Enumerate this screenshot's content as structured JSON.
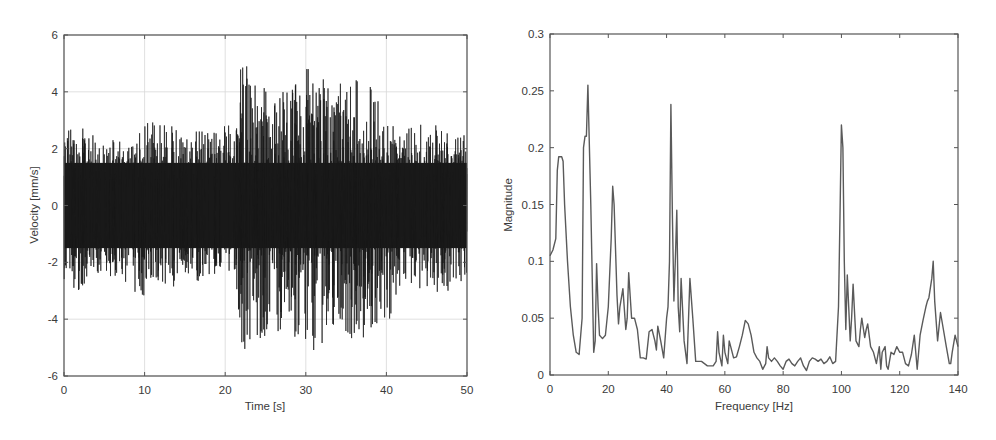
{
  "figure": {
    "background": "#ffffff",
    "axis_color": "#555555",
    "grid_color": "#d8d8d8",
    "signal_color": "#1a1a1a",
    "spectrum_color": "#5a5a5a"
  },
  "chart_data": [
    {
      "id": "time-domain",
      "type": "line",
      "title": "",
      "xlabel": "Time [s]",
      "ylabel": "Velocity [mm/s]",
      "xlim": [
        0,
        50
      ],
      "ylim": [
        -6,
        6
      ],
      "xticks": [
        0,
        10,
        20,
        30,
        40,
        50
      ],
      "xtick_labels": [
        "0",
        "10",
        "20",
        "30",
        "40",
        "50"
      ],
      "yticks": [
        -6,
        -4,
        -2,
        0,
        2,
        4,
        6
      ],
      "ytick_labels": [
        "-6",
        "-4",
        "-2",
        "0",
        "2",
        "4",
        "6"
      ],
      "grid": true,
      "frame_px": {
        "left": 64,
        "right": 467,
        "top": 35,
        "bottom": 376
      },
      "description": "Dense vibration velocity signal; approx ±2–3 mm/s envelope 0–21 s, larger bursts up to ±5–5.5 mm/s between ~21–40 s, then back to ±2–3 mm/s to 50 s",
      "envelope": {
        "t": [
          0,
          2,
          5,
          9,
          10,
          15,
          20,
          21.5,
          22,
          25,
          28,
          30,
          30.5,
          33,
          35,
          37,
          39,
          40,
          42,
          45,
          47,
          50
        ],
        "upper": [
          2.9,
          2.8,
          2.3,
          2.4,
          3.2,
          2.7,
          2.8,
          3.5,
          5.1,
          4.2,
          4.3,
          4.9,
          4.8,
          4.4,
          4.3,
          4.5,
          4.1,
          3.3,
          2.6,
          3.0,
          2.8,
          2.6
        ],
        "lower": [
          -2.6,
          -3.1,
          -2.3,
          -3.3,
          -3.3,
          -2.7,
          -2.6,
          -3.0,
          -5.3,
          -4.6,
          -4.6,
          -4.9,
          -5.6,
          -4.4,
          -4.7,
          -4.7,
          -4.5,
          -4.3,
          -2.8,
          -3.1,
          -3.2,
          -2.5
        ]
      },
      "notable_peaks": [
        {
          "t": 22.2,
          "value": 5.1
        },
        {
          "t": 30.6,
          "value": -5.6
        },
        {
          "t": 22.3,
          "value": -5.3
        }
      ]
    },
    {
      "id": "frequency-domain",
      "type": "line",
      "title": "",
      "xlabel": "Frequency [Hz]",
      "ylabel": "Magnitude",
      "xlim": [
        0,
        140
      ],
      "ylim": [
        0,
        0.3
      ],
      "xticks": [
        0,
        20,
        40,
        60,
        80,
        100,
        120,
        140
      ],
      "xtick_labels": [
        "0",
        "20",
        "40",
        "60",
        "80",
        "100",
        "120",
        "140"
      ],
      "yticks": [
        0,
        0.05,
        0.1,
        0.15,
        0.2,
        0.25,
        0.3
      ],
      "ytick_labels": [
        "0",
        "0.05",
        "0.1",
        "0.15",
        "0.2",
        "0.25",
        "0.3"
      ],
      "grid": false,
      "frame_px": {
        "left": 550,
        "right": 958,
        "top": 34,
        "bottom": 375
      },
      "x": [
        0,
        1,
        2,
        2.5,
        3,
        4,
        4.5,
        5,
        6,
        7,
        8,
        9,
        10,
        11,
        11.5,
        12,
        12.5,
        13,
        14,
        15,
        15.5,
        16,
        16.5,
        17,
        18,
        19,
        20,
        21,
        21.5,
        22,
        23,
        23.5,
        24,
        25,
        26,
        26.5,
        27,
        28,
        29,
        30,
        31,
        32,
        33,
        34,
        35,
        36,
        36.5,
        37,
        38,
        39,
        40,
        40.5,
        41,
        41.5,
        42,
        42.5,
        43,
        43.5,
        44,
        44.5,
        45,
        46,
        47,
        48,
        49,
        50,
        52,
        54,
        56,
        57,
        57.5,
        58,
        59,
        59.5,
        60,
        61,
        61.5,
        62,
        63,
        64,
        65,
        66,
        67,
        68,
        69,
        70,
        71,
        72,
        73,
        74,
        74.5,
        75,
        76,
        77,
        78,
        79,
        80,
        81,
        82,
        83,
        84,
        85,
        86,
        87,
        88,
        89,
        90,
        91,
        92,
        93,
        94,
        95,
        96,
        97,
        98,
        99,
        99.5,
        100,
        100.5,
        101,
        101.5,
        102,
        102.5,
        103,
        103.5,
        104,
        105,
        106,
        106.5,
        107,
        108,
        108.5,
        109,
        110,
        111,
        112,
        113,
        113.5,
        114,
        115,
        115.5,
        116,
        117,
        118,
        119,
        120,
        121,
        122,
        123,
        124,
        125,
        126,
        127,
        128,
        129,
        129.5,
        130,
        131,
        131.5,
        132,
        133,
        134,
        135,
        136,
        137,
        137.5,
        138,
        139,
        140
      ],
      "values": [
        0.105,
        0.11,
        0.12,
        0.18,
        0.192,
        0.192,
        0.188,
        0.15,
        0.1,
        0.06,
        0.035,
        0.02,
        0.018,
        0.05,
        0.2,
        0.21,
        0.21,
        0.255,
        0.15,
        0.02,
        0.03,
        0.098,
        0.06,
        0.035,
        0.032,
        0.035,
        0.06,
        0.12,
        0.166,
        0.15,
        0.07,
        0.045,
        0.06,
        0.076,
        0.04,
        0.05,
        0.09,
        0.05,
        0.05,
        0.04,
        0.015,
        0.015,
        0.014,
        0.038,
        0.04,
        0.03,
        0.022,
        0.043,
        0.03,
        0.015,
        0.05,
        0.06,
        0.1,
        0.238,
        0.14,
        0.065,
        0.1,
        0.145,
        0.06,
        0.038,
        0.085,
        0.03,
        0.01,
        0.085,
        0.05,
        0.012,
        0.012,
        0.008,
        0.008,
        0.012,
        0.038,
        0.02,
        0.008,
        0.035,
        0.02,
        0.01,
        0.03,
        0.025,
        0.015,
        0.016,
        0.025,
        0.035,
        0.048,
        0.045,
        0.035,
        0.02,
        0.015,
        0.012,
        0.005,
        0.01,
        0.025,
        0.015,
        0.012,
        0.015,
        0.012,
        0.008,
        0.005,
        0.012,
        0.014,
        0.01,
        0.008,
        0.012,
        0.015,
        0.008,
        0.004,
        0.012,
        0.015,
        0.014,
        0.012,
        0.014,
        0.01,
        0.012,
        0.016,
        0.01,
        0.012,
        0.06,
        0.14,
        0.22,
        0.2,
        0.1,
        0.04,
        0.088,
        0.06,
        0.03,
        0.05,
        0.08,
        0.03,
        0.025,
        0.04,
        0.05,
        0.033,
        0.04,
        0.045,
        0.025,
        0.02,
        0.01,
        0.025,
        0.005,
        0.02,
        0.025,
        0.008,
        0.005,
        0.02,
        0.018,
        0.025,
        0.02,
        0.02,
        0.01,
        0.008,
        0.018,
        0.035,
        0.005,
        0.035,
        0.048,
        0.06,
        0.065,
        0.068,
        0.085,
        0.1,
        0.065,
        0.03,
        0.055,
        0.04,
        0.025,
        0.01,
        0.01,
        0.02,
        0.035,
        0.025,
        0.01,
        0.015
      ],
      "notable_peaks": [
        {
          "freq": 3.5,
          "value": 0.192
        },
        {
          "freq": 13,
          "value": 0.255
        },
        {
          "freq": 21.5,
          "value": 0.166
        },
        {
          "freq": 41.5,
          "value": 0.238
        },
        {
          "freq": 43.5,
          "value": 0.145
        },
        {
          "freq": 100,
          "value": 0.22
        },
        {
          "freq": 129.5,
          "value": 0.1
        }
      ]
    }
  ]
}
